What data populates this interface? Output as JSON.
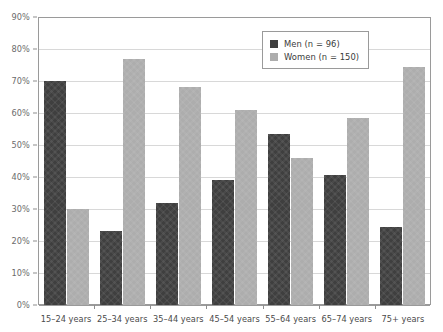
{
  "chart_data": {
    "type": "bar",
    "title": "",
    "subtitle": "",
    "xlabel": "",
    "ylabel": "",
    "categories": [
      "15–24 years",
      "25–34 years",
      "35–44 years",
      "45–54 years",
      "55–64 years",
      "65–74 years",
      "75+ years"
    ],
    "series": [
      {
        "name": "Men (n = 96)",
        "color": "#3f3f3f",
        "values": [
          70,
          23,
          32,
          39,
          53.5,
          40.5,
          24.5
        ]
      },
      {
        "name": "Women (n = 150)",
        "color": "#adadad",
        "values": [
          30,
          77,
          68,
          61,
          46,
          58.5,
          74.5
        ]
      }
    ],
    "ylim": [
      0,
      90
    ],
    "ytick_values": [
      0,
      10,
      20,
      30,
      40,
      50,
      60,
      70,
      80,
      90
    ],
    "ytick_labels": [
      "0%",
      "10%",
      "20%",
      "30%",
      "40%",
      "50%",
      "60%",
      "70%",
      "80%",
      "90%"
    ],
    "grid": true,
    "legend_position": "top-right",
    "tick_suffix": "%"
  },
  "legend": {
    "entries": [
      {
        "label": "Men (n = 96)",
        "swatch": "men"
      },
      {
        "label": "Women (n = 150)",
        "swatch": "women"
      }
    ]
  },
  "colors": {
    "men": "#3f3f3f",
    "women": "#adadad",
    "gridline": "#d8d8d8",
    "axis": "#9a9a9a",
    "tick_text": "#6b6b6b",
    "category_text": "#4a4a4a",
    "background": "#ffffff"
  }
}
